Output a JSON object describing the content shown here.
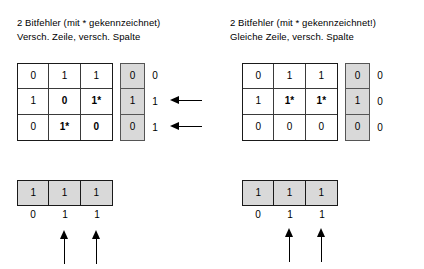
{
  "panels": [
    {
      "id": "left",
      "caption": {
        "line1": "2 Bitfehler (mit * gekennzeichnet)",
        "line2": "Versch. Zeile, versch. Spalte"
      },
      "matrix": {
        "rows": [
          [
            {
              "value": "0",
              "error": false
            },
            {
              "value": "1",
              "error": false
            },
            {
              "value": "1",
              "error": false
            }
          ],
          [
            {
              "value": "1",
              "error": false
            },
            {
              "value": "0",
              "error": true
            },
            {
              "value": "1*",
              "error": true
            }
          ],
          [
            {
              "value": "0",
              "error": false
            },
            {
              "value": "1*",
              "error": true
            },
            {
              "value": "0",
              "error": true
            }
          ]
        ]
      },
      "row_parity": {
        "stored": [
          "0",
          "1",
          "0"
        ],
        "computed": [
          "0",
          "1",
          "1"
        ],
        "mismatch_arrows": [
          false,
          true,
          true
        ]
      },
      "col_parity": {
        "stored": [
          "1",
          "1",
          "1"
        ],
        "computed": [
          "0",
          "1",
          "1"
        ],
        "mismatch_arrows": [
          false,
          true,
          true
        ]
      }
    },
    {
      "id": "right",
      "caption": {
        "line1": "2 Bitfehler (mit * gekennzeichnet!)",
        "line2": "Gleiche Zeile, versch. Spalte"
      },
      "matrix": {
        "rows": [
          [
            {
              "value": "0",
              "error": false
            },
            {
              "value": "1",
              "error": false
            },
            {
              "value": "1",
              "error": false
            }
          ],
          [
            {
              "value": "1",
              "error": false
            },
            {
              "value": "1*",
              "error": true
            },
            {
              "value": "1*",
              "error": true
            }
          ],
          [
            {
              "value": "0",
              "error": false
            },
            {
              "value": "0",
              "error": false
            },
            {
              "value": "0",
              "error": false
            }
          ]
        ]
      },
      "row_parity": {
        "stored": [
          "0",
          "1",
          "0"
        ],
        "computed": [
          "0",
          "0",
          "0"
        ],
        "mismatch_arrows": [
          false,
          false,
          false
        ]
      },
      "col_parity": {
        "stored": [
          "1",
          "1",
          "1"
        ],
        "computed": [
          "0",
          "1",
          "1"
        ],
        "mismatch_arrows": [
          false,
          true,
          true
        ]
      }
    }
  ],
  "colors": {
    "parity_fill": "#d9d9d9",
    "grid_line": "#1a1a1a",
    "text": "#000000",
    "background": "#ffffff"
  }
}
